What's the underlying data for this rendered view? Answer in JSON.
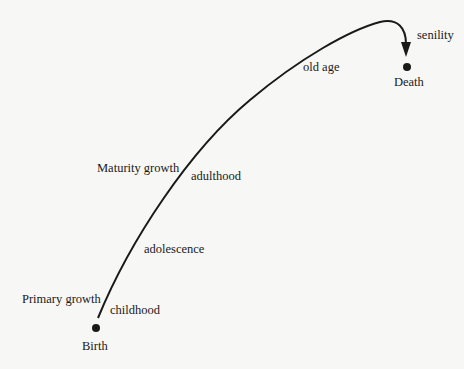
{
  "diagram": {
    "type": "life-cycle curve",
    "endpoints": {
      "start": "Birth",
      "end": "Death"
    },
    "stages": [
      {
        "label": "childhood"
      },
      {
        "label": "adolescence"
      },
      {
        "label": "adulthood"
      },
      {
        "label": "old age"
      },
      {
        "label": "senility"
      }
    ],
    "growth_phases": [
      {
        "label": "Primary growth"
      },
      {
        "label": "Maturity growth"
      }
    ],
    "colors": {
      "line": "#1a1a1a",
      "background": "#f7f7f5"
    }
  }
}
